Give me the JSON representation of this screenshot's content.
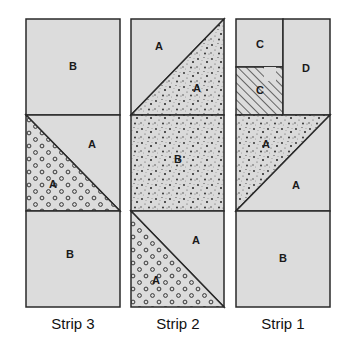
{
  "diagram": {
    "type": "quilt-block-assembly",
    "colors": {
      "background": "#ffffff",
      "fabric_plain": "#dcdcdc",
      "fabric_speckle": "#dadada",
      "outline": "#2a2a2a"
    },
    "fabric_patterns": [
      "plain-gray",
      "speckled-dots",
      "open-circles",
      "diagonal-hatch"
    ],
    "strips": [
      {
        "caption": "Strip 3",
        "pieces": [
          {
            "label": "B",
            "shape": "square",
            "fabric": "plain-gray"
          },
          {
            "label": "A",
            "shape": "triangle-upper-right",
            "fabric": "plain-gray"
          },
          {
            "label": "A",
            "shape": "triangle-lower-left",
            "fabric": "open-circles"
          },
          {
            "label": "B",
            "shape": "square",
            "fabric": "plain-gray"
          }
        ]
      },
      {
        "caption": "Strip 2",
        "pieces": [
          {
            "label": "A",
            "shape": "triangle-upper-left",
            "fabric": "plain-gray"
          },
          {
            "label": "A",
            "shape": "triangle-lower-right",
            "fabric": "speckled-dots"
          },
          {
            "label": "B",
            "shape": "square",
            "fabric": "speckled-dots"
          },
          {
            "label": "A",
            "shape": "triangle-upper-right",
            "fabric": "plain-gray"
          },
          {
            "label": "A",
            "shape": "triangle-lower-left",
            "fabric": "open-circles"
          }
        ]
      },
      {
        "caption": "Strip 1",
        "pieces": [
          {
            "label": "C",
            "shape": "small-square",
            "fabric": "plain-gray"
          },
          {
            "label": "C",
            "shape": "small-square",
            "fabric": "diagonal-hatch"
          },
          {
            "label": "D",
            "shape": "rectangle",
            "fabric": "plain-gray"
          },
          {
            "label": "A",
            "shape": "triangle-upper-left",
            "fabric": "speckled-dots"
          },
          {
            "label": "A",
            "shape": "triangle-lower-right",
            "fabric": "plain-gray"
          },
          {
            "label": "B",
            "shape": "square",
            "fabric": "plain-gray"
          }
        ]
      }
    ]
  }
}
